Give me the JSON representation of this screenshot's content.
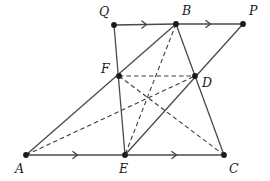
{
  "figure": {
    "type": "geometry-diagram",
    "title": "",
    "background_color": "#ffffff",
    "stroke_color": "#444444",
    "point_color": "#1b1b1b",
    "label_color": "#1b1b1b",
    "width": 270,
    "height": 181
  },
  "points": {
    "A": {
      "label": "A",
      "x": 26,
      "y": 155,
      "label_x": 15,
      "label_y": 173
    },
    "B": {
      "label": "B",
      "x": 176,
      "y": 24,
      "label_x": 182,
      "label_y": 15
    },
    "C": {
      "label": "C",
      "x": 224,
      "y": 155,
      "label_x": 229,
      "label_y": 173
    },
    "D": {
      "label": "D",
      "x": 195,
      "y": 76,
      "label_x": 202,
      "label_y": 87
    },
    "E": {
      "label": "E",
      "x": 125,
      "y": 155,
      "label_x": 119,
      "label_y": 173
    },
    "F": {
      "label": "F",
      "x": 119,
      "y": 76,
      "label_x": 101,
      "label_y": 73
    },
    "P": {
      "label": "P",
      "x": 243,
      "y": 24,
      "label_x": 249,
      "label_y": 15
    },
    "Q": {
      "label": "Q",
      "x": 114,
      "y": 25,
      "label_x": 99,
      "label_y": 16
    }
  },
  "solid_segments": [
    {
      "name": "segment-Q-B",
      "from": "Q",
      "to": "B",
      "tick": "single-arrow"
    },
    {
      "name": "segment-B-P",
      "from": "B",
      "to": "P",
      "tick": "single-arrow"
    },
    {
      "name": "segment-A-E",
      "from": "A",
      "to": "E",
      "tick": "single-arrow"
    },
    {
      "name": "segment-E-C",
      "from": "E",
      "to": "C",
      "tick": "single-arrow"
    },
    {
      "name": "segment-Q-E",
      "from": "Q",
      "to": "E",
      "tick": "none"
    },
    {
      "name": "segment-A-B",
      "from": "A",
      "to": "B",
      "tick": "none"
    },
    {
      "name": "segment-B-C",
      "from": "B",
      "to": "C",
      "tick": "none"
    },
    {
      "name": "segment-E-P",
      "from": "E",
      "to": "P",
      "tick": "none"
    }
  ],
  "dashed_segments": [
    {
      "name": "segment-A-D",
      "from": "A",
      "to": "D"
    },
    {
      "name": "segment-F-C",
      "from": "F",
      "to": "C"
    },
    {
      "name": "segment-B-E",
      "from": "B",
      "to": "E"
    },
    {
      "name": "segment-F-D",
      "from": "F",
      "to": "D"
    }
  ],
  "vertex_order": [
    "A",
    "B",
    "C",
    "D",
    "E",
    "F",
    "P",
    "Q"
  ]
}
